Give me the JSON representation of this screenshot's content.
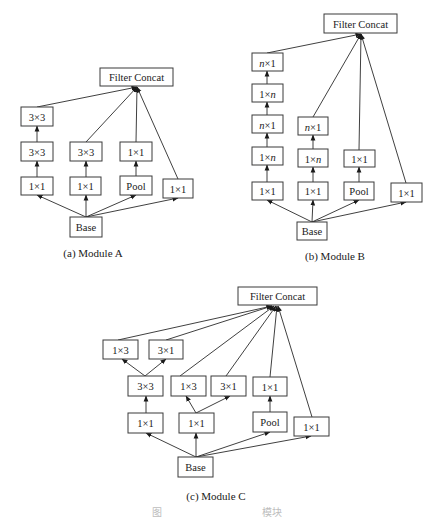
{
  "modules": [
    {
      "id": "a",
      "caption": "(a) Module A",
      "caption_pos": [
        93,
        257
      ],
      "concat_point": [
        137,
        87
      ],
      "boxes": [
        {
          "id": "concat",
          "label": "Filter Concat",
          "x": 100,
          "y": 68,
          "w": 73,
          "h": 18
        },
        {
          "id": "c1_3x3_top",
          "label": "3×3",
          "x": 21,
          "y": 107,
          "w": 32,
          "h": 19
        },
        {
          "id": "c1_3x3_mid",
          "label": "3×3",
          "x": 21,
          "y": 142,
          "w": 32,
          "h": 19
        },
        {
          "id": "c1_1x1",
          "label": "1×1",
          "x": 21,
          "y": 177,
          "w": 32,
          "h": 18
        },
        {
          "id": "c2_3x3",
          "label": "3×3",
          "x": 70,
          "y": 142,
          "w": 32,
          "h": 19
        },
        {
          "id": "c2_1x1",
          "label": "1×1",
          "x": 70,
          "y": 177,
          "w": 31,
          "h": 18
        },
        {
          "id": "c3_1x1",
          "label": "1×1",
          "x": 120,
          "y": 142,
          "w": 32,
          "h": 19
        },
        {
          "id": "c3_pool",
          "label": "Pool",
          "x": 120,
          "y": 176,
          "w": 32,
          "h": 19
        },
        {
          "id": "c4_1x1",
          "label": "1×1",
          "x": 163,
          "y": 179,
          "w": 30,
          "h": 19
        },
        {
          "id": "base",
          "label": "Base",
          "x": 70,
          "y": 217,
          "w": 32,
          "h": 20
        }
      ],
      "edges": [
        {
          "from": [
            86,
            217
          ],
          "to": [
            37,
            195
          ]
        },
        {
          "from": [
            86,
            217
          ],
          "to": [
            86,
            195
          ]
        },
        {
          "from": [
            86,
            217
          ],
          "to": [
            136,
            195
          ]
        },
        {
          "from": [
            86,
            217
          ],
          "to": [
            178,
            198
          ]
        },
        {
          "from": [
            37,
            177
          ],
          "to": [
            37,
            161
          ]
        },
        {
          "from": [
            37,
            142
          ],
          "to": [
            37,
            126
          ]
        },
        {
          "from": [
            86,
            177
          ],
          "to": [
            86,
            161
          ]
        },
        {
          "from": [
            136,
            176
          ],
          "to": [
            136,
            161
          ]
        },
        {
          "from": [
            37,
            107
          ],
          "to": [
            137,
            87
          ]
        },
        {
          "from": [
            86,
            142
          ],
          "to": [
            137,
            87
          ]
        },
        {
          "from": [
            136,
            142
          ],
          "to": [
            137,
            87
          ]
        },
        {
          "from": [
            178,
            179
          ],
          "to": [
            137,
            87
          ]
        }
      ]
    },
    {
      "id": "b",
      "caption": "(b) Module B",
      "caption_pos": [
        335,
        260
      ],
      "concat_point": [
        361,
        34
      ],
      "boxes": [
        {
          "id": "concat",
          "label": "Filter Concat",
          "x": 324,
          "y": 14,
          "w": 73,
          "h": 19
        },
        {
          "id": "c1_nx1_top",
          "label": "n×1",
          "italic_n": "lead",
          "x": 252,
          "y": 53,
          "w": 31,
          "h": 18
        },
        {
          "id": "c1_1xn_top",
          "label": "1×n",
          "italic_n": "trail",
          "x": 252,
          "y": 84,
          "w": 31,
          "h": 18
        },
        {
          "id": "c1_nx1_mid",
          "label": "n×1",
          "italic_n": "lead",
          "x": 252,
          "y": 115,
          "w": 31,
          "h": 18
        },
        {
          "id": "c1_1xn_mid",
          "label": "1×n",
          "italic_n": "trail",
          "x": 252,
          "y": 147,
          "w": 31,
          "h": 18
        },
        {
          "id": "c1_1x1",
          "label": "1×1",
          "x": 252,
          "y": 182,
          "w": 31,
          "h": 18
        },
        {
          "id": "c2_nx1",
          "label": "n×1",
          "italic_n": "lead",
          "x": 298,
          "y": 117,
          "w": 30,
          "h": 18
        },
        {
          "id": "c2_1xn",
          "label": "1×n",
          "italic_n": "trail",
          "x": 298,
          "y": 149,
          "w": 30,
          "h": 18
        },
        {
          "id": "c2_1x1",
          "label": "1×1",
          "x": 298,
          "y": 182,
          "w": 30,
          "h": 18
        },
        {
          "id": "c3_1x1",
          "label": "1×1",
          "x": 344,
          "y": 150,
          "w": 31,
          "h": 17
        },
        {
          "id": "c3_pool",
          "label": "Pool",
          "x": 344,
          "y": 182,
          "w": 30,
          "h": 18
        },
        {
          "id": "c4_1x1",
          "label": "1×1",
          "x": 391,
          "y": 183,
          "w": 31,
          "h": 19
        },
        {
          "id": "base",
          "label": "Base",
          "x": 297,
          "y": 222,
          "w": 30,
          "h": 18
        }
      ],
      "edges": [
        {
          "from": [
            312,
            222
          ],
          "to": [
            267,
            200
          ]
        },
        {
          "from": [
            312,
            222
          ],
          "to": [
            313,
            200
          ]
        },
        {
          "from": [
            312,
            222
          ],
          "to": [
            359,
            200
          ]
        },
        {
          "from": [
            312,
            222
          ],
          "to": [
            406,
            202
          ]
        },
        {
          "from": [
            267,
            182
          ],
          "to": [
            267,
            165
          ]
        },
        {
          "from": [
            267,
            147
          ],
          "to": [
            267,
            133
          ]
        },
        {
          "from": [
            267,
            115
          ],
          "to": [
            267,
            102
          ]
        },
        {
          "from": [
            267,
            84
          ],
          "to": [
            267,
            71
          ]
        },
        {
          "from": [
            313,
            182
          ],
          "to": [
            313,
            167
          ]
        },
        {
          "from": [
            313,
            149
          ],
          "to": [
            313,
            135
          ]
        },
        {
          "from": [
            359,
            182
          ],
          "to": [
            359,
            167
          ]
        },
        {
          "from": [
            267,
            53
          ],
          "to": [
            361,
            34
          ]
        },
        {
          "from": [
            313,
            117
          ],
          "to": [
            361,
            34
          ]
        },
        {
          "from": [
            359,
            150
          ],
          "to": [
            361,
            34
          ]
        },
        {
          "from": [
            406,
            183
          ],
          "to": [
            361,
            34
          ]
        }
      ]
    },
    {
      "id": "c",
      "caption": "(c) Module C",
      "caption_pos": [
        216,
        500
      ],
      "concat_point": [
        274,
        306
      ],
      "boxes": [
        {
          "id": "concat",
          "label": "Filter Concat",
          "x": 238,
          "y": 287,
          "w": 79,
          "h": 18
        },
        {
          "id": "c1_1x3_top",
          "label": "1×3",
          "x": 103,
          "y": 340,
          "w": 35,
          "h": 19
        },
        {
          "id": "c1_3x1_top",
          "label": "3×1",
          "x": 149,
          "y": 340,
          "w": 34,
          "h": 19
        },
        {
          "id": "c1_3x3",
          "label": "3×3",
          "x": 128,
          "y": 376,
          "w": 35,
          "h": 20
        },
        {
          "id": "c1_1x1",
          "label": "1×1",
          "x": 128,
          "y": 413,
          "w": 35,
          "h": 20
        },
        {
          "id": "c2_1x3",
          "label": "1×3",
          "x": 171,
          "y": 376,
          "w": 35,
          "h": 20
        },
        {
          "id": "c2_3x1",
          "label": "3×1",
          "x": 211,
          "y": 376,
          "w": 35,
          "h": 20
        },
        {
          "id": "c2_1x1",
          "label": "1×1",
          "x": 179,
          "y": 413,
          "w": 35,
          "h": 20
        },
        {
          "id": "c3_1x1",
          "label": "1×1",
          "x": 253,
          "y": 377,
          "w": 34,
          "h": 19
        },
        {
          "id": "c3_pool",
          "label": "Pool",
          "x": 253,
          "y": 412,
          "w": 34,
          "h": 20
        },
        {
          "id": "c4_1x1",
          "label": "1×1",
          "x": 294,
          "y": 417,
          "w": 35,
          "h": 19
        },
        {
          "id": "base",
          "label": "Base",
          "x": 178,
          "y": 457,
          "w": 35,
          "h": 20
        }
      ],
      "edges": [
        {
          "from": [
            196,
            457
          ],
          "to": [
            146,
            433
          ]
        },
        {
          "from": [
            196,
            457
          ],
          "to": [
            196,
            433
          ]
        },
        {
          "from": [
            196,
            457
          ],
          "to": [
            270,
            432
          ]
        },
        {
          "from": [
            196,
            457
          ],
          "to": [
            311,
            436
          ]
        },
        {
          "from": [
            146,
            413
          ],
          "to": [
            146,
            396
          ]
        },
        {
          "from": [
            196,
            413
          ],
          "to": [
            186,
            396
          ]
        },
        {
          "from": [
            196,
            413
          ],
          "to": [
            230,
            396
          ]
        },
        {
          "from": [
            270,
            412
          ],
          "to": [
            270,
            396
          ]
        },
        {
          "from": [
            145,
            376
          ],
          "to": [
            122,
            359
          ]
        },
        {
          "from": [
            145,
            376
          ],
          "to": [
            166,
            359
          ]
        },
        {
          "from": [
            118,
            340
          ],
          "to": [
            272,
            306
          ]
        },
        {
          "from": [
            166,
            340
          ],
          "to": [
            272,
            306
          ]
        },
        {
          "from": [
            180,
            376
          ],
          "to": [
            274,
            306
          ]
        },
        {
          "from": [
            226,
            376
          ],
          "to": [
            276,
            306
          ]
        },
        {
          "from": [
            270,
            377
          ],
          "to": [
            277,
            306
          ]
        },
        {
          "from": [
            312,
            417
          ],
          "to": [
            278,
            306
          ]
        }
      ]
    }
  ],
  "figure_caption": {
    "left_glyph": "图",
    "right_glyphs": "模块",
    "left_pos": [
      152,
      516
    ],
    "right_pos": [
      262,
      516
    ]
  },
  "colors": {
    "stroke": "#3a3a3a",
    "text": "#1a1a1a",
    "background": "#ffffff"
  }
}
